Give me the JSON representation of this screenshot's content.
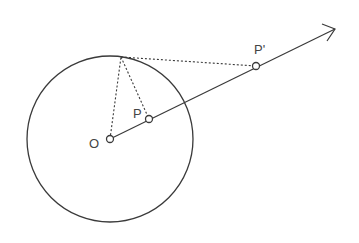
{
  "diagram": {
    "labels": {
      "center": "O",
      "point": "P",
      "inverse_point": "P'"
    },
    "colors": {
      "stroke": "#3a3a3a",
      "background": "#ffffff"
    },
    "geometry": {
      "circle_center": [
        110,
        139
      ],
      "circle_radius": 83,
      "point_P": [
        149,
        119
      ],
      "point_P_prime": [
        256,
        66
      ],
      "tangent_point": [
        121,
        57
      ],
      "ray_end": [
        335,
        29
      ]
    }
  }
}
